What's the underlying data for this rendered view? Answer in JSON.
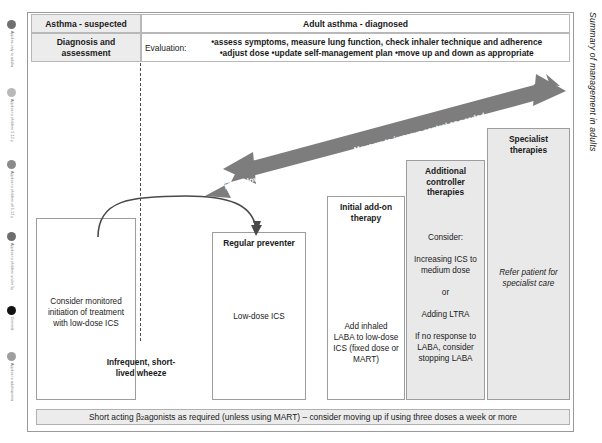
{
  "side_title": "Summary of management in adults",
  "legend": {
    "items": [
      {
        "label": "Applies only to adults",
        "color": "#707070",
        "top": 0
      },
      {
        "label": "Applies to children 5-12 y",
        "color": "#b9b9b9",
        "top": 68
      },
      {
        "label": "Applies to children of 5-12 y",
        "color": "#8a8a8a",
        "top": 140
      },
      {
        "label": "Applies to children under 5y",
        "color": "#6e6e6e",
        "top": 212
      },
      {
        "label": "General",
        "color": "#121212",
        "top": 286
      },
      {
        "label": "Applies to adolescents",
        "color": "#9e9e9e",
        "top": 332
      }
    ]
  },
  "header": {
    "col_suspected": "Asthma - suspected",
    "col_diagnosed": "Adult asthma - diagnosed",
    "row_label": "Diagnosis and assessment",
    "eval_prefix": "Evaluation:",
    "eval_line1": "•assess symptoms, measure lung function, check inhaler technique and adherence",
    "eval_line2": "•adjust dose •update self-management plan •move up and down as appropriate"
  },
  "arrows": {
    "up_label": "Move up to improve control as needed",
    "down_label": "Move down to find and maintain lowest controlling therapy"
  },
  "steps": {
    "consider": {
      "title": "",
      "body": "Consider monitored initiation of treatment with low-dose ICS"
    },
    "preventer": {
      "title": "Regular preventer",
      "body": "Low-dose ICS"
    },
    "addon": {
      "title": "Initial add-on therapy",
      "body": "Add inhaled LABA to low-dose ICS (fixed dose or MART)"
    },
    "additional": {
      "title": "Additional controller therapies",
      "line1": "Consider:",
      "line2": "Increasing ICS to medium dose",
      "line3": "or",
      "line4": "Adding LTRA",
      "line5": "If no response to LABA, consider stopping LABA"
    },
    "specialist": {
      "title": "Specialist therapies",
      "body": "Refer patient for specialist care"
    }
  },
  "wheeze_label": "Infrequent, short-lived wheeze",
  "bottom_bar": {
    "prefix": "Short acting β",
    "subscript": "2",
    "suffix": " agonists as required (unless using MART) – consider moving up if using three doses a week or more"
  },
  "colors": {
    "arrow_grey": "#7d7d7d",
    "box_grey": "#e9e9e9",
    "border_grey": "#9d9d9d",
    "header_shade": "#ececec"
  }
}
